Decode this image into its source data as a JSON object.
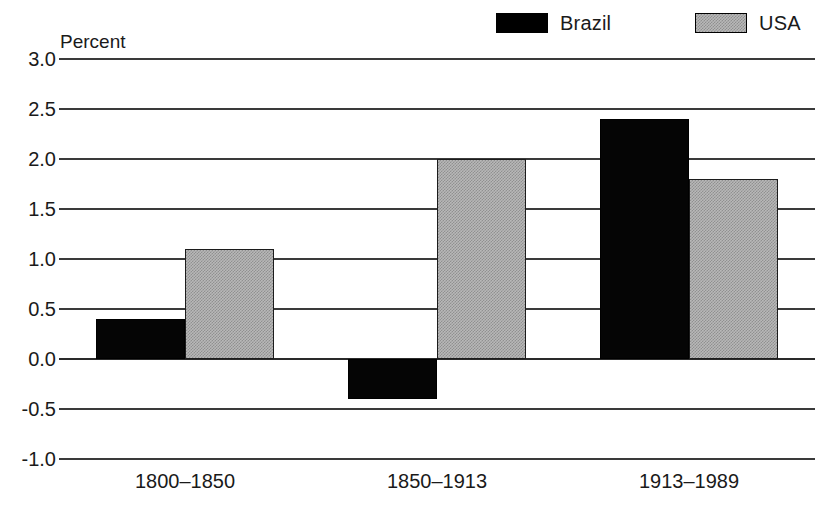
{
  "chart_data": {
    "type": "bar",
    "title": "",
    "subtitle": "",
    "xlabel": "",
    "ylabel": "Percent",
    "categories": [
      "1800–1850",
      "1850–1913",
      "1913–1989"
    ],
    "series": [
      {
        "name": "Brazil",
        "color": "#000000",
        "fill": "solid-black",
        "values": [
          0.4,
          -0.4,
          2.4
        ]
      },
      {
        "name": "USA",
        "color": "#b8b8b8",
        "fill": "stipple-gray",
        "values": [
          1.1,
          2.0,
          1.8
        ]
      }
    ],
    "ylim": [
      -1.0,
      3.0
    ],
    "yticks": [
      "3.0",
      "2.5",
      "2.0",
      "1.5",
      "1.0",
      "0.5",
      "0.0",
      "-0.5",
      "-1.0"
    ],
    "ytick_values": [
      3.0,
      2.5,
      2.0,
      1.5,
      1.0,
      0.5,
      0.0,
      -0.5,
      -1.0
    ],
    "grid": true,
    "legend_position": "top-right",
    "legend": [
      "Brazil",
      "USA"
    ]
  },
  "axis": {
    "y_title": "Percent"
  },
  "legend": {
    "brazil_label": "Brazil",
    "usa_label": "USA"
  }
}
